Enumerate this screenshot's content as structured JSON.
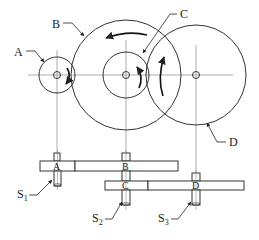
{
  "diagram": {
    "title": "",
    "colors": {
      "line": "#333333",
      "thin": "#666666",
      "background": "#ffffff"
    },
    "gears": [
      {
        "id": "A",
        "label": "A",
        "cx": 57,
        "cy": 75,
        "r": 18,
        "hub_r": 3.5
      },
      {
        "id": "B",
        "label": "B",
        "cx": 126,
        "cy": 75,
        "r": 55,
        "hub_r": 3.5
      },
      {
        "id": "C",
        "label": "C",
        "cx": 126,
        "cy": 75,
        "r": 23,
        "hub_r": 3.5
      },
      {
        "id": "D",
        "label": "D",
        "cx": 196,
        "cy": 75,
        "r": 50,
        "hub_r": 3.5
      }
    ],
    "callouts": {
      "A": "A",
      "B": "B",
      "C": "C",
      "D": "D"
    },
    "side_view": {
      "top_bar_labels": [
        "A",
        "B"
      ],
      "bottom_bar_labels": [
        "C",
        "D"
      ]
    },
    "shafts": [
      {
        "id": "S1",
        "base": "S",
        "sub": "1"
      },
      {
        "id": "S2",
        "base": "S",
        "sub": "2"
      },
      {
        "id": "S3",
        "base": "S",
        "sub": "3"
      }
    ]
  }
}
